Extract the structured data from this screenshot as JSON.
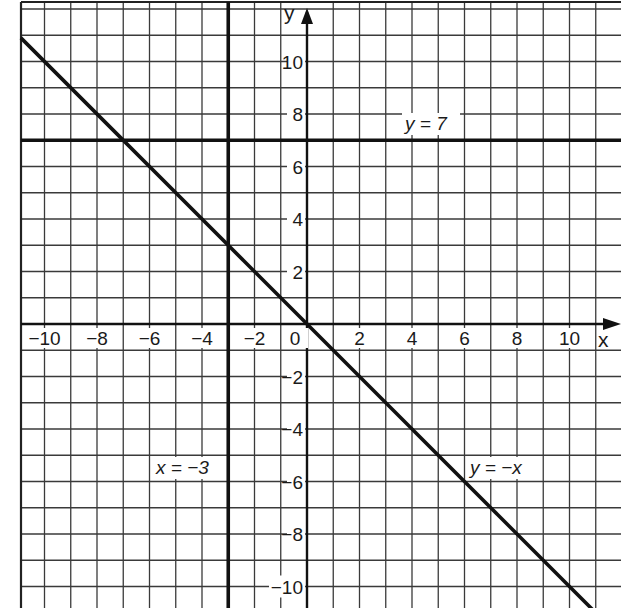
{
  "chart_data": {
    "type": "line",
    "title": "",
    "xlabel": "x",
    "ylabel": "y",
    "xlim": [
      -10.9,
      11.9
    ],
    "ylim": [
      -10.8,
      12.25
    ],
    "grid": true,
    "grid_step": 1,
    "x_ticks": [
      -10,
      -8,
      -6,
      -4,
      -2,
      0,
      2,
      4,
      6,
      8,
      10
    ],
    "x_tick_labels": [
      "−10",
      "−8",
      "−6",
      "−4",
      "−2",
      "0",
      "2",
      "4",
      "6",
      "8",
      "10"
    ],
    "y_ticks": [
      10,
      8,
      6,
      4,
      2,
      -2,
      -4,
      -6,
      -8,
      -10
    ],
    "y_tick_labels": [
      "10",
      "8",
      "6",
      "4",
      "2",
      "−2",
      "−4",
      "−6",
      "−8",
      "−10"
    ],
    "series": [
      {
        "name": "y = 7",
        "kind": "horizontal",
        "y": 7,
        "label": "y = 7",
        "label_at": [
          5,
          7.5
        ]
      },
      {
        "name": "x = −3",
        "kind": "vertical",
        "x": -3,
        "label": "x = −3",
        "label_at": [
          -4.5,
          -5.5
        ]
      },
      {
        "name": "y = −x",
        "kind": "line",
        "slope": -1,
        "intercept": 0,
        "label": "y = −x",
        "label_at": [
          6.8,
          -5.5
        ]
      }
    ],
    "annotations": [
      {
        "text": "y = 7",
        "near": "line y=7, right of y-axis"
      },
      {
        "text": "x = −3",
        "near": "line x=-3, left side, lower half"
      },
      {
        "text": "y = −x",
        "near": "diagonal line, lower right"
      }
    ]
  },
  "labels": {
    "x_axis": "x",
    "y_axis": "y",
    "eq_y7": "y = 7",
    "eq_xm3": "x = −3",
    "eq_ymx": "y = −x"
  }
}
